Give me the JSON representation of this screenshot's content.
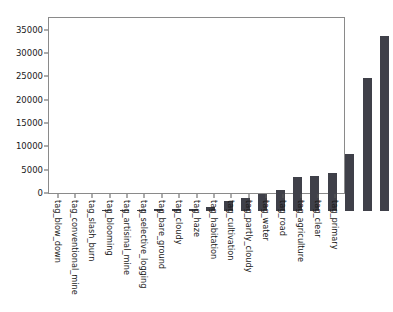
{
  "chart_data": {
    "type": "bar",
    "title": "",
    "xlabel": "",
    "ylabel": "",
    "grid": false,
    "legend": null,
    "ylim": [
      0,
      37500
    ],
    "yticks": [
      0,
      5000,
      10000,
      15000,
      20000,
      25000,
      30000,
      35000
    ],
    "ytick_labels": [
      "0",
      "5000",
      "10000",
      "15000",
      "20000",
      "25000",
      "30000",
      "35000"
    ],
    "bar_color": "#3f4049",
    "categories": [
      "tag_blow_down",
      "tag_conventional_mine",
      "tag_slash_burn",
      "tag_blooming",
      "tag_artisinal_mine",
      "tag_selective_logging",
      "tag_bare_ground",
      "tag_cloudy",
      "tag_haze",
      "tag_habitation",
      "tag_cultivation",
      "tag_partly_cloudy",
      "tag_water",
      "tag_road",
      "tag_agriculture",
      "tag_clear",
      "tag_primary"
    ],
    "values": [
      100,
      100,
      209,
      332,
      339,
      340,
      862,
      2089,
      2697,
      3660,
      4477,
      7261,
      7411,
      8071,
      12315,
      28431,
      37513
    ]
  }
}
